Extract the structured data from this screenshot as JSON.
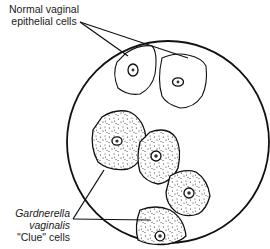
{
  "labels": {
    "normal": {
      "line1": "Normal vaginal",
      "line2": "epithelial cells"
    },
    "clue": {
      "line1": "Gardnerella",
      "line2": "vaginalis",
      "line3": "\"Clue\" cells"
    }
  },
  "diagram": {
    "field": "microscope-field-circle",
    "normal_cell_count": 2,
    "clue_cell_count": 4,
    "stroke_color": "#111111",
    "background": "#ffffff"
  }
}
